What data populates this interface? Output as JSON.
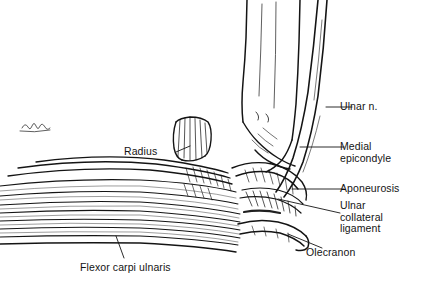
{
  "figure": {
    "type": "anatomical-line-drawing",
    "background_color": "#ffffff",
    "ink_color": "#141414",
    "signature": "artist-signature-scribble"
  },
  "labels": {
    "ulnar_nerve": "Ulnar n.",
    "medial_epicondyle": "Medial\nepicondyle",
    "aponeurosis": "Aponeurosis",
    "ulnar_collateral_ligament": "Ulnar\ncollateral\nligament",
    "olecranon": "Olecranon",
    "radius": "Radius",
    "flexor_carpi_ulnaris": "Flexor carpi ulnaris"
  }
}
